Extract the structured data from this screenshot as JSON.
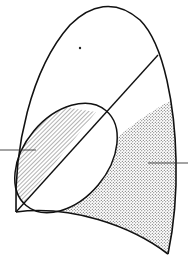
{
  "diagram": {
    "colors": {
      "background": "#ffffff",
      "stroke": "#111111",
      "hatch": "#555555",
      "stipple": "#444444"
    },
    "regions": [
      {
        "id": "hatched-region",
        "fill": "diagonal-hatch"
      },
      {
        "id": "stippled-region",
        "fill": "dot-stipple"
      }
    ],
    "leaders": [
      {
        "id": "left-leader",
        "y": 150
      },
      {
        "id": "right-leader",
        "y": 163
      }
    ],
    "labels": []
  }
}
